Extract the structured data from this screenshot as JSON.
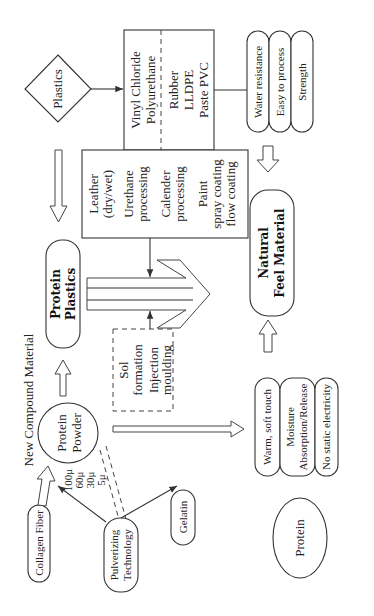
{
  "diagram": {
    "title": "New Compound Material",
    "nodes": {
      "plastics": {
        "label": "Plastics",
        "shape": "diamond"
      },
      "plastic_types": {
        "left": [
          "Vinyl Chloride",
          "Polyurethane"
        ],
        "right": [
          "Rubber",
          "LLDPE",
          "Paste PVC"
        ]
      },
      "plastic_properties": [
        "Water resistance",
        "Easy to process",
        "Strength"
      ],
      "processing": {
        "items": [
          [
            "Leather",
            "(dry/wet)"
          ],
          [
            "Urethane",
            "processing"
          ],
          [
            "Calender",
            "processing"
          ],
          [
            "Paint",
            "spray coating",
            "flow coating"
          ]
        ]
      },
      "protein_plastics": [
        "Protein",
        "Plastics"
      ],
      "natural_feel_material": [
        "Natural",
        "Feel Material"
      ],
      "sol_box": {
        "items": [
          [
            "Sol",
            "formation"
          ],
          [
            "Injection",
            "moulding"
          ]
        ]
      },
      "protein_powder": {
        "label": [
          "Protein",
          "Powder"
        ],
        "sizes": [
          "100μ",
          "60μ",
          "30μ",
          "5μ"
        ]
      },
      "protein_properties": [
        [
          "Warm, soft touch"
        ],
        [
          "Moisture",
          "Absorption/Release"
        ],
        [
          "No static electricity"
        ]
      ],
      "collagen_fiber": "Collagen Fiber",
      "pulverizing": [
        "Pulverizing",
        "Technology"
      ],
      "gelatin": "Gelatin",
      "protein": "Protein"
    },
    "colors": {
      "line": "#333333",
      "background": "#ffffff",
      "text": "#222222"
    }
  }
}
